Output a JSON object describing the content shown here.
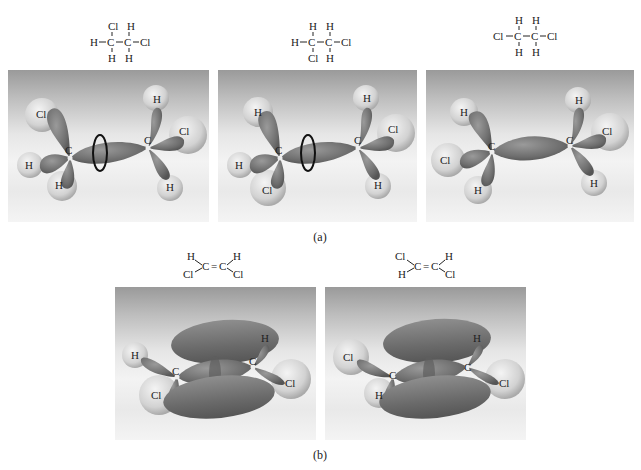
{
  "figure": {
    "part_a": {
      "caption": "(a)",
      "molecules": [
        {
          "formula_top": [
            "Cl",
            "H"
          ],
          "formula_middle": [
            "H",
            "C",
            "C",
            "Cl"
          ],
          "formula_bottom": [
            "H",
            "H"
          ],
          "model_labels": {
            "left_c": "C",
            "right_c": "C",
            "l1": "Cl",
            "l2": "H",
            "l3": "H",
            "r1": "H",
            "r2": "Cl",
            "r3": "H"
          },
          "rotation_arrow": true
        },
        {
          "formula_top": [
            "H",
            "H"
          ],
          "formula_middle": [
            "H",
            "C",
            "C",
            "Cl"
          ],
          "formula_bottom": [
            "Cl",
            "H"
          ],
          "model_labels": {
            "left_c": "C",
            "right_c": "C",
            "l1": "H",
            "l2": "H",
            "l3": "Cl",
            "r1": "H",
            "r2": "Cl",
            "r3": "H"
          },
          "rotation_arrow": true
        },
        {
          "formula_top": [
            "H",
            "H"
          ],
          "formula_middle": [
            "Cl",
            "C",
            "C",
            "Cl"
          ],
          "formula_bottom": [
            "H",
            "H"
          ],
          "model_labels": {
            "left_c": "C",
            "right_c": "C",
            "l1": "H",
            "l2": "Cl",
            "l3": "H",
            "r1": "H",
            "r2": "Cl",
            "r3": "H"
          },
          "rotation_arrow": false
        }
      ]
    },
    "part_b": {
      "caption": "(b)",
      "molecules": [
        {
          "formula": {
            "tl": "H",
            "bl": "Cl",
            "c1": "C",
            "bond": "=",
            "c2": "C",
            "tr": "H",
            "br": "Cl"
          },
          "model_labels": {
            "left_c": "C",
            "right_c": "C",
            "l1": "H",
            "l2": "Cl",
            "r1": "H",
            "r2": "Cl"
          }
        },
        {
          "formula": {
            "tl": "Cl",
            "bl": "H",
            "c1": "C",
            "bond": "=",
            "c2": "C",
            "tr": "H",
            "br": "Cl"
          },
          "model_labels": {
            "left_c": "C",
            "right_c": "C",
            "l1": "Cl",
            "l2": "H",
            "r1": "H",
            "r2": "Cl"
          }
        }
      ]
    },
    "colors": {
      "orbital": "#7a7a7a",
      "atom_sphere": "#d8d8d8",
      "panel_top": "#9a9a9a",
      "panel_bottom": "#f3f3f3",
      "arrow": "#111111"
    }
  }
}
